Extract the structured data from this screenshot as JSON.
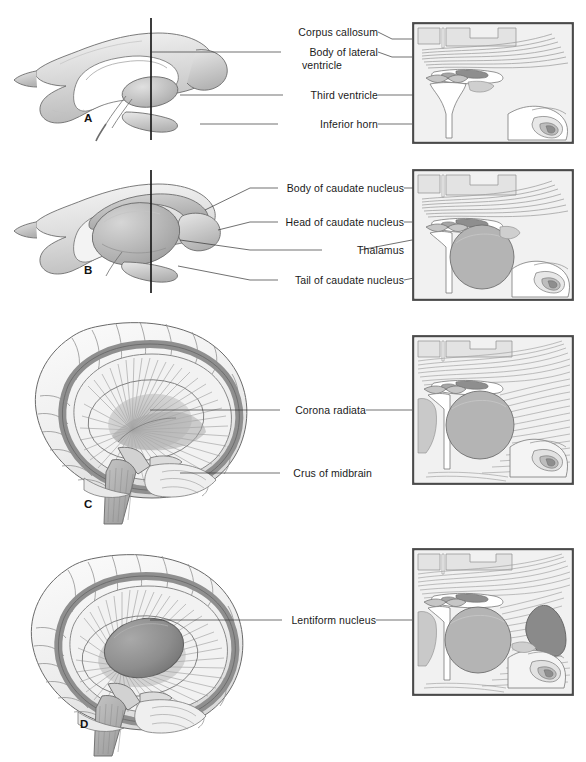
{
  "figure": {
    "background": "#ffffff",
    "panel_count": 4
  },
  "palette": {
    "line": "#555555",
    "label_text": "#1a1a1a",
    "leader_line": "#333333",
    "inset_border": "#4a4a4a",
    "inset_background": "#f1f1f1",
    "gray_lightest": "#f2f2f2",
    "gray_light": "#e2e2e2",
    "gray_mid": "#c9c9c9",
    "gray_mid_dark": "#a8a8a8",
    "gray_dark": "#8c8c8c",
    "gray_darkest": "#6f6f6f"
  },
  "panels": [
    {
      "id": "A",
      "letter": "A",
      "subject": "lateral-ventricle-cast",
      "section_line": "vertical coronal plane",
      "labels": [
        {
          "id": "corpus-callosum",
          "text": "Corpus callosum",
          "lines": [
            "Corpus callosum"
          ]
        },
        {
          "id": "body-of-lateral-ventricle",
          "text": "Body of lateral ventricle",
          "lines": [
            "Body of lateral",
            "ventricle"
          ]
        },
        {
          "id": "third-ventricle",
          "text": "Third ventricle",
          "lines": [
            "Third ventricle"
          ]
        },
        {
          "id": "inferior-horn",
          "text": "Inferior horn",
          "lines": [
            "Inferior horn"
          ]
        }
      ]
    },
    {
      "id": "B",
      "letter": "B",
      "subject": "ventricle-cast-with-basal-ganglia",
      "section_line": "vertical coronal plane",
      "labels": [
        {
          "id": "body-of-caudate-nucleus",
          "text": "Body of caudate nucleus",
          "lines": [
            "Body of caudate nucleus"
          ]
        },
        {
          "id": "head-of-caudate-nucleus",
          "text": "Head of caudate nucleus",
          "lines": [
            "Head of caudate nucleus"
          ]
        },
        {
          "id": "thalamus",
          "text": "Thalamus",
          "lines": [
            "Thalamus"
          ]
        },
        {
          "id": "tail-of-caudate-nucleus",
          "text": "Tail of caudate nucleus",
          "lines": [
            "Tail of caudate nucleus"
          ]
        }
      ]
    },
    {
      "id": "C",
      "letter": "C",
      "subject": "brain-with-corona-radiata",
      "labels": [
        {
          "id": "corona-radiata",
          "text": "Corona radiata",
          "lines": [
            "Corona radiata"
          ]
        },
        {
          "id": "crus-of-midbrain",
          "text": "Crus of midbrain",
          "lines": [
            "Crus of midbrain"
          ]
        }
      ]
    },
    {
      "id": "D",
      "letter": "D",
      "subject": "brain-with-lentiform-nucleus",
      "labels": [
        {
          "id": "lentiform-nucleus",
          "text": "Lentiform nucleus",
          "lines": [
            "Lentiform nucleus"
          ]
        }
      ]
    }
  ],
  "insets": [
    {
      "id": "inset-A",
      "panel": "A",
      "caption": "",
      "shows": [
        "corpus callosum fibers",
        "lateral ventricles",
        "third ventricle",
        "inferior horn",
        "hippocampus"
      ]
    },
    {
      "id": "inset-B",
      "panel": "B",
      "caption": "",
      "shows": [
        "caudate nucleus",
        "thalamus",
        "third ventricle"
      ]
    },
    {
      "id": "inset-C",
      "panel": "C",
      "caption": "",
      "shows": [
        "corona radiata fibers",
        "thalamus",
        "internal capsule"
      ]
    },
    {
      "id": "inset-D",
      "panel": "D",
      "caption": "",
      "shows": [
        "lentiform nucleus",
        "thalamus",
        "corona radiata"
      ]
    }
  ]
}
